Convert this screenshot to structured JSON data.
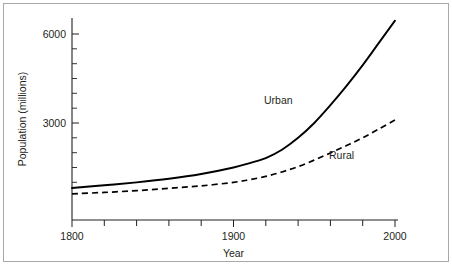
{
  "chart_data": {
    "type": "line",
    "title": "",
    "xlabel": "Year",
    "ylabel": "Population (millions)",
    "xlim": [
      1800,
      2000
    ],
    "ylim": [
      0,
      6600
    ],
    "grid": false,
    "legend_position": "inline-annotations",
    "x_ticks_labeled": [
      "1800",
      "1900",
      "2000"
    ],
    "x_tick_values": [
      1800,
      1820,
      1840,
      1860,
      1880,
      1900,
      1920,
      1940,
      1960,
      1980,
      2000
    ],
    "y_ticks_labeled": [
      "3000",
      "6000"
    ],
    "y_tick_values": [
      3000,
      6000
    ],
    "y_minor_tick_values": [
      1000,
      1500,
      2000,
      2500,
      3500,
      4000,
      4500,
      5000,
      5500
    ],
    "x": [
      1800,
      1820,
      1840,
      1860,
      1880,
      1900,
      1910,
      1920,
      1930,
      1940,
      1950,
      1960,
      1970,
      1980,
      1990,
      2000
    ],
    "series": [
      {
        "name": "Urban",
        "style": "solid",
        "color": "#000000",
        "values": [
          810,
          900,
          1000,
          1120,
          1280,
          1500,
          1650,
          1820,
          2100,
          2500,
          3000,
          3600,
          4250,
          4950,
          5700,
          6450
        ]
      },
      {
        "name": "Rural",
        "style": "dashed",
        "color": "#000000",
        "values": [
          610,
          660,
          720,
          800,
          880,
          1000,
          1090,
          1200,
          1350,
          1530,
          1750,
          1990,
          2240,
          2500,
          2800,
          3100
        ]
      }
    ],
    "annotations": [
      {
        "text": "Urban",
        "x": 1960,
        "y": 4400
      },
      {
        "text": "Rural",
        "x": 1990,
        "y": 2500
      }
    ]
  },
  "labels": {
    "y_axis_title": "Population (millions)",
    "x_axis_title": "Year",
    "y_tick_6000": "6000",
    "y_tick_3000": "3000",
    "x_tick_1800": "1800",
    "x_tick_1900": "1900",
    "x_tick_2000": "2000",
    "series_urban": "Urban",
    "series_rural": "Rural"
  },
  "colors": {
    "ink": "#231f20",
    "frame": "#a9a9a9",
    "background": "#ffffff",
    "curve": "#000000"
  }
}
